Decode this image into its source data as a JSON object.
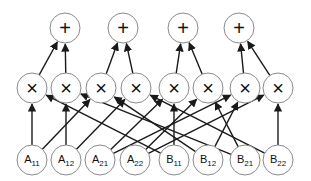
{
  "diagram": {
    "title": "",
    "layers": {
      "sum": [
        {
          "id": "s1",
          "label": "+",
          "x": 65,
          "y": 28
        },
        {
          "id": "s2",
          "label": "+",
          "x": 123,
          "y": 28
        },
        {
          "id": "s3",
          "label": "+",
          "x": 183,
          "y": 28
        },
        {
          "id": "s4",
          "label": "+",
          "x": 239,
          "y": 28
        }
      ],
      "product": [
        {
          "id": "m1",
          "label": "×",
          "x": 32,
          "y": 88
        },
        {
          "id": "m2",
          "label": "×",
          "x": 66,
          "y": 88
        },
        {
          "id": "m3",
          "label": "×",
          "x": 101,
          "y": 88
        },
        {
          "id": "m4",
          "label": "×",
          "x": 136,
          "y": 88
        },
        {
          "id": "m5",
          "label": "×",
          "x": 174,
          "y": 88
        },
        {
          "id": "m6",
          "label": "×",
          "x": 208,
          "y": 88
        },
        {
          "id": "m7",
          "label": "×",
          "x": 245,
          "y": 88
        },
        {
          "id": "m8",
          "label": "×",
          "x": 278,
          "y": 88
        }
      ],
      "input": [
        {
          "id": "A11",
          "base": "A",
          "sub": "11",
          "x": 32,
          "y": 160
        },
        {
          "id": "A12",
          "base": "A",
          "sub": "12",
          "x": 66,
          "y": 160
        },
        {
          "id": "A21",
          "base": "A",
          "sub": "21",
          "x": 100,
          "y": 160
        },
        {
          "id": "A22",
          "base": "A",
          "sub": "22",
          "x": 135,
          "y": 160
        },
        {
          "id": "B11",
          "base": "B",
          "sub": "11",
          "x": 174,
          "y": 160
        },
        {
          "id": "B12",
          "base": "B",
          "sub": "12",
          "x": 208,
          "y": 160
        },
        {
          "id": "B21",
          "base": "B",
          "sub": "21",
          "x": 245,
          "y": 160
        },
        {
          "id": "B22",
          "base": "B",
          "sub": "22",
          "x": 278,
          "y": 160
        }
      ]
    },
    "edges": [
      {
        "from": "A11",
        "to": "m1"
      },
      {
        "from": "B11",
        "to": "m1"
      },
      {
        "from": "A12",
        "to": "m2"
      },
      {
        "from": "B21",
        "to": "m2"
      },
      {
        "from": "A11",
        "to": "m3"
      },
      {
        "from": "B12",
        "to": "m3"
      },
      {
        "from": "A12",
        "to": "m4"
      },
      {
        "from": "B22",
        "to": "m4"
      },
      {
        "from": "A21",
        "to": "m5"
      },
      {
        "from": "B11",
        "to": "m5"
      },
      {
        "from": "A22",
        "to": "m6"
      },
      {
        "from": "B21",
        "to": "m6"
      },
      {
        "from": "A21",
        "to": "m7"
      },
      {
        "from": "B12",
        "to": "m7"
      },
      {
        "from": "A22",
        "to": "m8"
      },
      {
        "from": "B22",
        "to": "m8"
      },
      {
        "from": "m1",
        "to": "s1"
      },
      {
        "from": "m2",
        "to": "s1"
      },
      {
        "from": "m3",
        "to": "s2"
      },
      {
        "from": "m4",
        "to": "s2"
      },
      {
        "from": "m5",
        "to": "s3"
      },
      {
        "from": "m6",
        "to": "s3"
      },
      {
        "from": "m7",
        "to": "s4"
      },
      {
        "from": "m8",
        "to": "s4"
      }
    ],
    "node_radius": 15,
    "colors": {
      "edge": "#1a1a1a",
      "node_stroke": "#8a8a8a",
      "background": "#ffffff"
    }
  }
}
